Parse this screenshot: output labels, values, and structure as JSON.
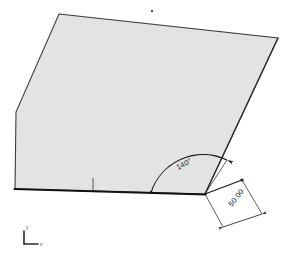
{
  "view": {
    "background_color": "#ffffff",
    "width": 291,
    "height": 255
  },
  "sketch": {
    "face": {
      "name": "shaded-quad-face",
      "fill_color": "#e3e3e3",
      "edge_color": "#3c3c3c",
      "vertices": "59,14 278,38 205,194 15,189 16,112"
    },
    "bottom_edge": {
      "color": "#111111",
      "from": "15,189",
      "to": "205,194"
    },
    "point_marker": {
      "name": "sketch-point",
      "x": 152,
      "y": 11,
      "color": "#555555"
    },
    "edge_tick": {
      "name": "edge-tick-mark",
      "x": 93,
      "y_top": 178,
      "y_bottom": 190,
      "color": "#444444"
    }
  },
  "dimensions": {
    "angle": {
      "label": "140°",
      "value": 140,
      "unit": "degrees",
      "vertex": "205,194",
      "arc_color": "#1a1a1a",
      "text_rotation": -28
    },
    "length": {
      "label": "50.00",
      "value": 50.0,
      "unit": "mm",
      "from": "205,194",
      "to": "242,180",
      "line_color": "#1a1a1a",
      "text_rotation": -52
    }
  },
  "axis_triad": {
    "name": "coordinate-triad",
    "origin_x": 24,
    "origin_y": 243,
    "y_label": "y",
    "x_label": "x",
    "color": "#2b2b2b"
  },
  "colors": {
    "face_fill": "#e3e3e3",
    "edge": "#3c3c3c",
    "strong_edge": "#111111",
    "annotation": "#1a1a1a"
  }
}
